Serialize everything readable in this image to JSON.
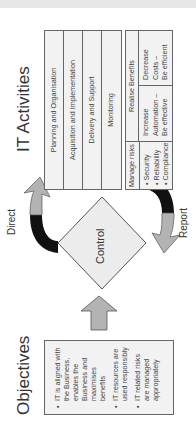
{
  "objectives": {
    "title": "Objectives",
    "items": [
      "IT is aligned with the Business, enables the Business and maximises benefits",
      "IT resources are used responsibly",
      "IT related risks are managed appropriately"
    ]
  },
  "control": {
    "label": "Control"
  },
  "arrows": {
    "direct_label": "Direct",
    "report_label": "Report"
  },
  "it_activities": {
    "title": "IT Activities",
    "processes": [
      "Planning and Organisation",
      "Acquisition and Implementation",
      "Delivery and Support",
      "Monitoring"
    ],
    "manage_risks": {
      "header": "Manage risks",
      "items": [
        "Security",
        "Reliability",
        "Compliance"
      ]
    },
    "realise_benefits": {
      "header": "Realise Benefits",
      "increase": [
        "Increase",
        "Automation –",
        "Be effective"
      ],
      "decrease": [
        "Decrease",
        "Costs –",
        "Be efficient"
      ]
    }
  },
  "colors": {
    "box_fill": "#f2f2f2",
    "border": "#666666",
    "arrow_gray": "#b3b3b3",
    "arrow_black": "#111111",
    "text": "#333333"
  }
}
